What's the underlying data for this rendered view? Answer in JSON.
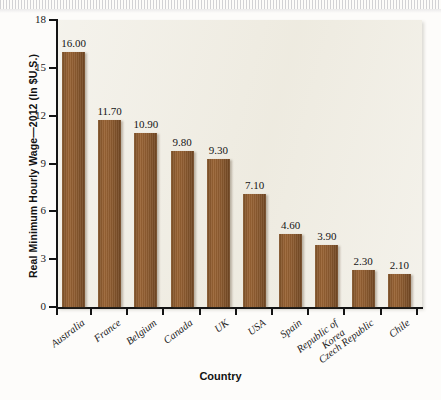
{
  "chart_data": {
    "type": "bar",
    "title": "",
    "xlabel": "Country",
    "ylabel": "Real Minimum Hourly Wage—2012 (In $U.S.)",
    "categories": [
      "Australia",
      "France",
      "Belgium",
      "Canada",
      "UK",
      "USA",
      "Spain",
      "Republic of\nKorea",
      "Czech Republic",
      "Chile"
    ],
    "values": [
      16.0,
      11.7,
      10.9,
      9.8,
      9.3,
      7.1,
      4.6,
      3.9,
      2.3,
      2.1
    ],
    "value_labels": [
      "16.00",
      "11.70",
      "10.90",
      "9.80",
      "9.30",
      "7.10",
      "4.60",
      "3.90",
      "2.30",
      "2.10"
    ],
    "ylim": [
      0,
      18
    ],
    "yticks": [
      0,
      3,
      6,
      9,
      12,
      15,
      18
    ],
    "ytick_labels": [
      "0",
      "3",
      "6",
      "9",
      "12",
      "15",
      "18"
    ],
    "grid": false,
    "legend": "none",
    "bar_color": "#8b5a2f",
    "panel_color": "#efece2",
    "axis_color": "#141414"
  }
}
